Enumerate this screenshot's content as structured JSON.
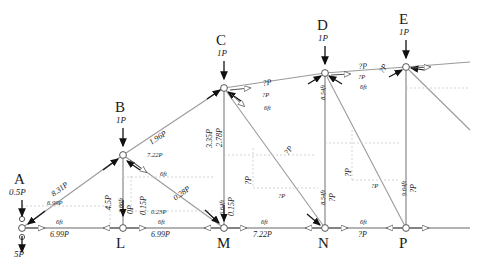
{
  "diagram": {
    "type": "truss-free-body-diagram",
    "colors": {
      "member": "#9a9a9a",
      "dashed": "#c0c0c0",
      "arrow": "#111111",
      "text": "#1a1a1a"
    },
    "top_nodes": [
      {
        "name": "A",
        "load": "0.5P"
      },
      {
        "name": "B",
        "load": "1P"
      },
      {
        "name": "C",
        "load": "1P"
      },
      {
        "name": "D",
        "load": "1P"
      },
      {
        "name": "E",
        "load": "1P"
      }
    ],
    "bottom_nodes": [
      {
        "name": "L"
      },
      {
        "name": "M"
      },
      {
        "name": "N"
      },
      {
        "name": "P"
      }
    ],
    "support_reaction": "5P",
    "top_chord_forces": [
      {
        "member": "A-B",
        "force": "8.31P",
        "horiz": "6.99P"
      },
      {
        "member": "B-C",
        "force": "1.96P",
        "horiz": "7.22P"
      },
      {
        "member": "C-D",
        "force": "?P",
        "horiz": "?P"
      },
      {
        "member": "D-E",
        "force": "?P",
        "horiz": "?P"
      }
    ],
    "bottom_chord_forces": [
      {
        "member": "A-L",
        "force": "6.99P"
      },
      {
        "member": "L-M",
        "force": "6.99P"
      },
      {
        "member": "M-N",
        "force": "7.22P"
      },
      {
        "member": "N-P",
        "force": "?P"
      }
    ],
    "verticals": [
      {
        "member": "B-L",
        "length": "3.86ft",
        "force": "0P"
      },
      {
        "member": "C-M",
        "length": "6.64ft",
        "force": "0.15P"
      },
      {
        "member": "D-N",
        "length": "8.54ft",
        "force": "?P"
      },
      {
        "member": "E-P",
        "length": "9.64ft",
        "force": "?P"
      }
    ],
    "diagonals": [
      {
        "member": "L-B",
        "force": "4.5P"
      },
      {
        "member": "B-M",
        "force": "0.28P",
        "horiz": "0.23P",
        "vert": "0.15P"
      },
      {
        "member": "C-M-web",
        "force": "3.35P",
        "vert": "2.78P"
      },
      {
        "member": "C-N",
        "force": "?P",
        "horiz": "?P",
        "vert": "?P"
      },
      {
        "member": "D-P",
        "force": "?P",
        "horiz": "?P",
        "vert": "?P"
      },
      {
        "member": "E-right",
        "force": "?P"
      }
    ],
    "panel_dims": [
      {
        "span": "A-L",
        "value": "6ft"
      },
      {
        "span": "L-M",
        "value": "6ft"
      },
      {
        "span": "M-N",
        "value": "6ft"
      },
      {
        "span": "N-P",
        "value": "6ft"
      },
      {
        "span": "B-C",
        "value": "6ft"
      },
      {
        "span": "C-D",
        "value": "6ft"
      },
      {
        "span": "D-E",
        "value": "6ft"
      }
    ],
    "labels": {
      "a": "A",
      "b": "B",
      "c": "C",
      "d": "D",
      "e": "E",
      "l": "L",
      "m": "M",
      "n": "N",
      "p": "P",
      "loadA": "0.5P",
      "loadB": "1P",
      "loadC": "1P",
      "loadD": "1P",
      "loadE": "1P",
      "reactionA": "5P",
      "f_ab": "8.31P",
      "f_ab_h": "6.99P",
      "f_bc": "1.96P",
      "f_bc_h": "7.22P",
      "f_cd": "?P",
      "f_cd_h": "?P",
      "f_de": "?P",
      "f_de_h": "?P",
      "f_al": "6.99P",
      "f_lm": "6.99P",
      "f_mn": "7.22P",
      "f_np": "?P",
      "v_bl_len": "3.86ft",
      "v_bl_f": "0P",
      "v_cm_len": "6.64ft",
      "v_cm_f": "0.15P",
      "v_dn_len": "8.54ft",
      "v_dn_f": "?P",
      "v_ep_len": "9.64ft",
      "v_ep_f": "?P",
      "d_lb": "4.5P",
      "d_bm": "0.28P",
      "d_bm_h": "0.23P",
      "d_bm_v": "0.15P",
      "d_cm": "3.35P",
      "d_cm_v": "2.78P",
      "d_cn": "?P",
      "d_cn_h": "?P",
      "d_cn_v": "?P",
      "d_dp": "?P",
      "d_dp_h": "?P",
      "d_dp_v": "?P",
      "d_e": "?P",
      "dim6_1": "6ft",
      "dim6_2": "6ft",
      "dim6_3": "6ft",
      "dim6_4": "6ft",
      "dim6_5": "6ft",
      "dim6_6": "6ft",
      "dim6_7": "6ft"
    }
  }
}
